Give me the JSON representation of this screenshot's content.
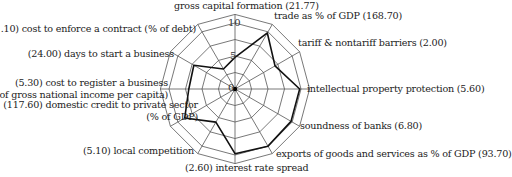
{
  "chart_data": {
    "type": "radar",
    "title": "",
    "center": [
      235,
      89
    ],
    "radial_ticks": [
      "0",
      "5",
      "10"
    ],
    "rmax": 10,
    "grid_rings": [
      2.5,
      5,
      7.5,
      10,
      11.3
    ],
    "axes": [
      "gross capital formation (21.77)",
      "trade as % of GDP (168.70)",
      "tariff & nontariff barriers (2.00)",
      "intellectual property protection (5.60)",
      "soundness of banks (6.80)",
      "exports of goods and services as % of GDP (93.70)",
      "(2.60) interest rate spread",
      "(5.10) local competition",
      "(117.60) domestic credit to private sector (% of GDP)",
      "(5.30) cost to register a business (% of gross national income per capita)",
      "(24.00) days to start a business",
      "(21.10) cost to enforce a contract (% of debt)"
    ],
    "series": [
      {
        "name": "score",
        "values": [
          4.8,
          9.8,
          7.0,
          9.8,
          9.8,
          10.0,
          9.8,
          5.8,
          8.8,
          7.0,
          7.2,
          3.5
        ]
      }
    ],
    "colors": {
      "grid": "#555555",
      "series": "#111111"
    }
  },
  "labels": {
    "gcf": "gross capital formation (21.77)",
    "trade": "trade as % of GDP (168.70)",
    "tariff": "tariff & nontariff barriers (2.00)",
    "ip": "intellectual property protection (5.60)",
    "banks": "soundness of banks (6.80)",
    "exports": "exports of goods and services as % of GDP (93.70)",
    "interest": "(2.60) interest rate spread",
    "competition": "(5.10) local competition",
    "credit_1": "(117.60) domestic credit to private sector",
    "credit_2": "(% of GDP)",
    "register_1": "(5.30) cost to register a business",
    "register_2": "(% of gross national income per capita)",
    "days": "(24.00) days to start a business",
    "enforce": "(21.10) cost to enforce a contract (% of debt)"
  },
  "ticks": {
    "t0": "0",
    "t5": "5",
    "t10": "10"
  }
}
